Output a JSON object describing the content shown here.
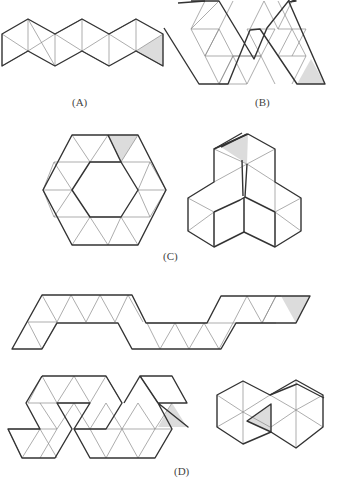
{
  "figure": {
    "panels": [
      {
        "id": "A",
        "label": "(A)",
        "description": "Zig-zag strip of 12 equilateral triangles with one shaded triangle at right end"
      },
      {
        "id": "B",
        "label": "(B)",
        "description": "W-shaped net of triangles with one shaded triangle at bottom right"
      },
      {
        "id": "C",
        "label": "(C)",
        "description": "Hexagonal ring net of 18 triangles with one shaded triangle, and its folded 3D form"
      },
      {
        "id": "D",
        "label": "(D)",
        "description": "Long S-shaped net, compact double-hexagon net, and folded form; shaded triangle marked in each"
      }
    ]
  },
  "colors": {
    "line_thick": "#333333",
    "line_thin": "#8a8a8a",
    "shade": "#dcdcdc",
    "background": "#ffffff"
  }
}
